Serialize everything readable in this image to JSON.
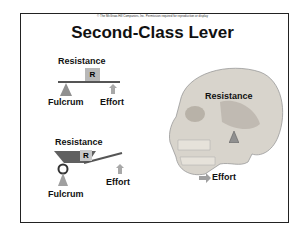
{
  "slide": {
    "copyright": "© The McGraw-Hill Companies, Inc. Permission required for reproduction or display",
    "title": "Second-Class Lever"
  },
  "diagram1": {
    "resistance_label": "Resistance",
    "box_label": "R",
    "fulcrum_label": "Fulcrum",
    "effort_label": "Effort"
  },
  "diagram2": {
    "resistance_label": "Resistance",
    "box_label": "R",
    "fulcrum_label": "Fulcrum",
    "effort_label": "Effort"
  },
  "skull": {
    "resistance_label": "Resistance",
    "effort_label": "Effort"
  },
  "colors": {
    "border": "#222222",
    "gray_fill": "#a0a0a0",
    "box_fill": "#b8b8b8",
    "bone": "#d8d4cc"
  }
}
